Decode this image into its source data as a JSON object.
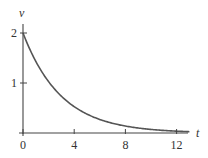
{
  "chart_data": {
    "type": "line",
    "title": "",
    "xlabel": "t",
    "ylabel": "v",
    "xlim": [
      0,
      13
    ],
    "ylim": [
      0,
      2
    ],
    "x_ticks": [
      0,
      4,
      8,
      12
    ],
    "x_tick_labels": [
      "0",
      "4",
      "8",
      "12"
    ],
    "y_ticks": [
      1,
      2
    ],
    "y_tick_labels": [
      "1",
      "2"
    ],
    "grid": false,
    "legend": null,
    "series": [
      {
        "name": "v(t) = 2e^(-t/3)",
        "x": [
          0,
          1,
          2,
          3,
          4,
          5,
          6,
          7,
          8,
          9,
          10,
          11,
          12,
          13
        ],
        "values": [
          2.0,
          1.43,
          1.03,
          0.74,
          0.53,
          0.38,
          0.27,
          0.19,
          0.14,
          0.1,
          0.07,
          0.05,
          0.04,
          0.03
        ]
      }
    ],
    "colors": {
      "curve": "#555555",
      "axis": "#444444"
    }
  }
}
